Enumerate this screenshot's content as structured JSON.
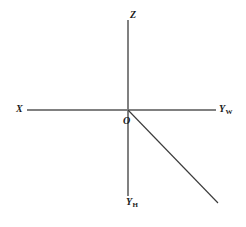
{
  "figure": {
    "background_color": "#ffffff",
    "axis_color": "#808080",
    "ray_color": "#3a3a3a",
    "label_color": "#1a1a1a",
    "width": 246,
    "height": 227
  },
  "labels": {
    "x_axis": "X",
    "y_w_axis_base": "Y",
    "y_w_axis_sub": "W",
    "z_axis": "Z",
    "y_h_axis_base": "Y",
    "y_h_axis_sub": "H",
    "origin": "O"
  },
  "geometry": {
    "origin": {
      "x": 128,
      "y": 110
    },
    "horizontal_axis": {
      "x1": 27,
      "y1": 110,
      "x2": 216,
      "y2": 110
    },
    "vertical_axis": {
      "x1": 128,
      "y1": 20,
      "x2": 128,
      "y2": 196
    },
    "diagonal_ray": {
      "x1": 128,
      "y1": 110,
      "x2": 218,
      "y2": 203
    }
  }
}
